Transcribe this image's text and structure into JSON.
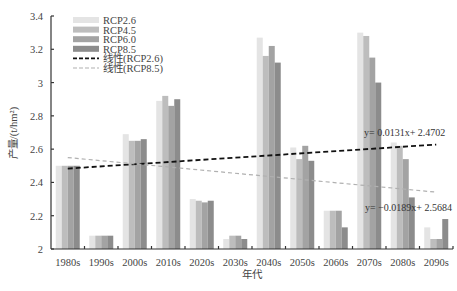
{
  "chart_data": {
    "type": "bar",
    "title": "",
    "xlabel": "年代",
    "ylabel": "产量/(t/hm²)",
    "ylim": [
      2,
      3.4
    ],
    "yticks": [
      2,
      2.2,
      2.4,
      2.6,
      2.8,
      3,
      3.2,
      3.4
    ],
    "ytick_labels": [
      "2",
      "2.2",
      "2.4",
      "2.6",
      "2.8",
      "3",
      "3.2",
      "3.4"
    ],
    "grid": false,
    "legend_position": "upper-left",
    "categories": [
      "1980s",
      "1990s",
      "2000s",
      "2010s",
      "2020s",
      "2030s",
      "2040s",
      "2050s",
      "2060s",
      "2070s",
      "2080s",
      "2090s"
    ],
    "series": [
      {
        "name": "RCP2.6",
        "color": "#e4e4e4",
        "values": [
          2.5,
          2.08,
          2.69,
          2.89,
          2.3,
          2.06,
          3.27,
          2.61,
          2.23,
          3.3,
          2.64,
          2.13
        ]
      },
      {
        "name": "RCP4.5",
        "color": "#bdbdbd",
        "values": [
          2.5,
          2.08,
          2.65,
          2.92,
          2.29,
          2.08,
          3.16,
          2.54,
          2.23,
          3.28,
          2.62,
          2.06
        ]
      },
      {
        "name": "RCP6.0",
        "color": "#a3a3a3",
        "values": [
          2.5,
          2.08,
          2.65,
          2.86,
          2.28,
          2.08,
          3.22,
          2.62,
          2.23,
          3.15,
          2.54,
          2.06
        ]
      },
      {
        "name": "RCP8.5",
        "color": "#8c8c8c",
        "values": [
          2.5,
          2.08,
          2.66,
          2.9,
          2.29,
          2.06,
          3.12,
          2.53,
          2.13,
          3.0,
          2.31,
          2.18
        ]
      }
    ],
    "trendlines": [
      {
        "name": "线性(RCP2.6)",
        "color": "#111111",
        "style": "dashed",
        "slope": 0.0131,
        "intercept": 2.4702,
        "equation": "y= 0.0131x+ 2.4702"
      },
      {
        "name": "线性(RCP8.5)",
        "color": "#b0b0b0",
        "style": "dashed",
        "slope": -0.0189,
        "intercept": 2.5684,
        "equation": "y= −0.0189x+ 2.5684"
      }
    ]
  }
}
